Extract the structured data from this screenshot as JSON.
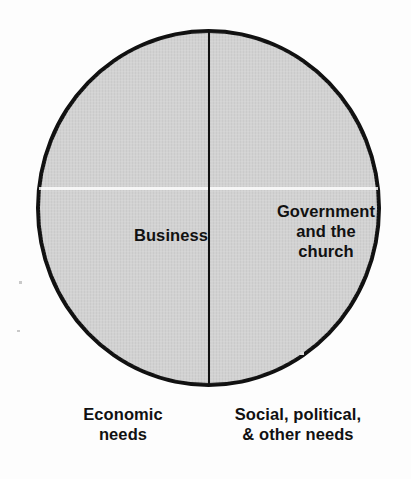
{
  "chart_data": {
    "type": "pie",
    "title": "",
    "subtitle": "",
    "xlabel": "",
    "ylabel": "",
    "legend_position": "none",
    "grid": false,
    "categories": [
      "Business",
      "Government and the church"
    ],
    "values": [
      50,
      50
    ],
    "units": "percent",
    "slices": [
      {
        "label": "Business",
        "label_lines": "Business",
        "value": 50,
        "start_angle": 180,
        "end_angle": 360,
        "position": "left-half",
        "fill_color": "#d2d2d2",
        "caption": "Economic\nneeds"
      },
      {
        "label": "Government and the church",
        "label_lines": "Government\nand the\nchurch",
        "value": 50,
        "start_angle": 0,
        "end_angle": 180,
        "position": "right-half",
        "fill_color": "#d2d2d2",
        "caption": "Social, political,\n& other needs"
      }
    ],
    "captions": {
      "left": "Economic\nneeds",
      "right": "Social, political,\n& other needs"
    },
    "colors": {
      "slice_fill": "#d2d2d2",
      "outline": "#111111",
      "divider": "#111111",
      "text": "#111111",
      "background": "#fdfdfd"
    }
  }
}
